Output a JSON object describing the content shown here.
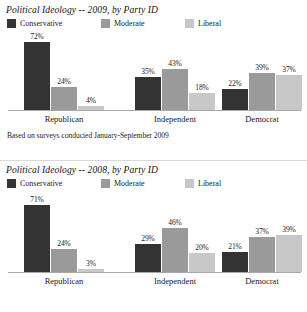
{
  "chart_data": [
    {
      "type": "bar",
      "title": "Political Ideology -- 2009, by Party ID",
      "categories": [
        "Republican",
        "Independent",
        "Democrat"
      ],
      "series": [
        {
          "name": "Conservative",
          "color": "#333333",
          "values": [
            72,
            24,
            22
          ]
        },
        {
          "name": "Moderate",
          "color": "#9a9a9a",
          "values": [
            24,
            43,
            39
          ]
        },
        {
          "name": "Liberal",
          "color": "#c8c8c8",
          "values": [
            4,
            18,
            37
          ]
        }
      ],
      "value_labels": [
        [
          "72%",
          "24%",
          "4%"
        ],
        [
          "35%",
          "43%",
          "18%"
        ],
        [
          "22%",
          "39%",
          "37%"
        ]
      ],
      "grouped_values": [
        [
          72,
          24,
          4
        ],
        [
          35,
          43,
          18
        ],
        [
          22,
          39,
          37
        ]
      ],
      "ylim": [
        0,
        80
      ],
      "xlabel": "",
      "ylabel": "",
      "grid": false,
      "legend_position": "top-left",
      "footnote": "Based on surveys conducted January-September 2009"
    },
    {
      "type": "bar",
      "title": "Political Ideology -- 2008, by Party ID",
      "categories": [
        "Republican",
        "Independent",
        "Democrat"
      ],
      "series": [
        {
          "name": "Conservative",
          "color": "#333333",
          "values": [
            71,
            29,
            21
          ]
        },
        {
          "name": "Moderate",
          "color": "#9a9a9a",
          "values": [
            24,
            46,
            37
          ]
        },
        {
          "name": "Liberal",
          "color": "#c8c8c8",
          "values": [
            3,
            20,
            39
          ]
        }
      ],
      "value_labels": [
        [
          "71%",
          "24%",
          "3%"
        ],
        [
          "29%",
          "46%",
          "20%"
        ],
        [
          "21%",
          "37%",
          "39%"
        ]
      ],
      "grouped_values": [
        [
          71,
          24,
          3
        ],
        [
          29,
          46,
          20
        ],
        [
          21,
          37,
          39
        ]
      ],
      "ylim": [
        0,
        80
      ],
      "xlabel": "",
      "ylabel": "",
      "grid": false,
      "legend_position": "top-left",
      "footnote": ""
    }
  ],
  "panel_2009": {
    "title": "Political Ideology -- 2009, by Party ID",
    "legend": [
      {
        "label": "Conservative",
        "color": "#333333"
      },
      {
        "label": "Moderate",
        "color": "#9a9a9a"
      },
      {
        "label": "Liberal",
        "color": "#c8c8c8"
      }
    ],
    "groups": [
      {
        "label": "Republican",
        "bars": [
          {
            "value": 72,
            "label": "72%",
            "color": "#333333"
          },
          {
            "value": 24,
            "label": "24%",
            "color": "#9a9a9a"
          },
          {
            "value": 4,
            "label": "4%",
            "color": "#c8c8c8"
          }
        ]
      },
      {
        "label": "Independent",
        "bars": [
          {
            "value": 35,
            "label": "35%",
            "color": "#333333"
          },
          {
            "value": 43,
            "label": "43%",
            "color": "#9a9a9a"
          },
          {
            "value": 18,
            "label": "18%",
            "color": "#c8c8c8"
          }
        ]
      },
      {
        "label": "Democrat",
        "bars": [
          {
            "value": 22,
            "label": "22%",
            "color": "#333333"
          },
          {
            "value": 39,
            "label": "39%",
            "color": "#9a9a9a"
          },
          {
            "value": 37,
            "label": "37%",
            "color": "#c8c8c8"
          }
        ]
      }
    ],
    "footnote": "Based on surveys conducted January-September 2009"
  },
  "panel_2008": {
    "title": "Political Ideology -- 2008, by Party ID",
    "legend": [
      {
        "label": "Conservative",
        "color": "#333333"
      },
      {
        "label": "Moderate",
        "color": "#9a9a9a"
      },
      {
        "label": "Liberal",
        "color": "#c8c8c8"
      }
    ],
    "groups": [
      {
        "label": "Republican",
        "bars": [
          {
            "value": 71,
            "label": "71%",
            "color": "#333333"
          },
          {
            "value": 24,
            "label": "24%",
            "color": "#9a9a9a"
          },
          {
            "value": 3,
            "label": "3%",
            "color": "#c8c8c8"
          }
        ]
      },
      {
        "label": "Independent",
        "bars": [
          {
            "value": 29,
            "label": "29%",
            "color": "#333333"
          },
          {
            "value": 46,
            "label": "46%",
            "color": "#9a9a9a"
          },
          {
            "value": 20,
            "label": "20%",
            "color": "#c8c8c8"
          }
        ]
      },
      {
        "label": "Democrat",
        "bars": [
          {
            "value": 21,
            "label": "21%",
            "color": "#333333"
          },
          {
            "value": 37,
            "label": "37%",
            "color": "#9a9a9a"
          },
          {
            "value": 39,
            "label": "39%",
            "color": "#c8c8c8"
          }
        ]
      }
    ],
    "footnote": ""
  }
}
